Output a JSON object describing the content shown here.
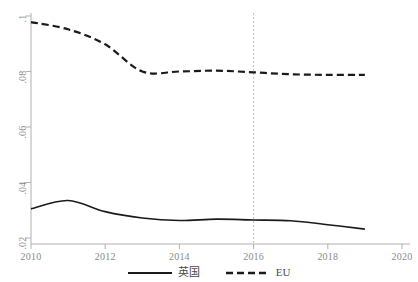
{
  "chart_data": {
    "type": "line",
    "title": "",
    "xlabel": "",
    "ylabel": "",
    "xlim": [
      2010,
      2020
    ],
    "ylim": [
      0.02,
      0.1
    ],
    "grid": false,
    "legend_position": "bottom",
    "x_ticks": [
      "2010",
      "2012",
      "2014",
      "2016",
      "2018",
      "2020"
    ],
    "x_tick_values": [
      2010,
      2012,
      2014,
      2016,
      2018,
      2020
    ],
    "y_ticks": [
      ".1",
      ".08",
      ".06",
      ".04",
      ".02"
    ],
    "y_tick_values": [
      0.1,
      0.08,
      0.06,
      0.04,
      0.02
    ],
    "x": [
      2010,
      2011,
      2012,
      2013,
      2014,
      2015,
      2016,
      2017,
      2018,
      2019
    ],
    "series": [
      {
        "name": "英国",
        "style": "solid",
        "color": "#1a1a1a",
        "values": [
          0.0305,
          0.0335,
          0.0295,
          0.0272,
          0.0263,
          0.0268,
          0.0265,
          0.0262,
          0.0248,
          0.0232
        ]
      },
      {
        "name": "EU",
        "style": "dashed",
        "color": "#1a1a1a",
        "values": [
          0.0978,
          0.0952,
          0.0898,
          0.08,
          0.08,
          0.0803,
          0.0797,
          0.079,
          0.0788,
          0.0788
        ]
      }
    ],
    "annotations": [
      {
        "name": "reference-line-2016",
        "type": "vline",
        "x": 2016,
        "style": "dotted",
        "color": "#bfbfbf"
      }
    ]
  },
  "legend": {
    "items": [
      {
        "label": "英国",
        "style": "solid"
      },
      {
        "label": "EU",
        "style": "dashed"
      }
    ]
  },
  "axes": {
    "line_color": "#b0b0b0",
    "tick_label_color": "#8a8a8a"
  }
}
